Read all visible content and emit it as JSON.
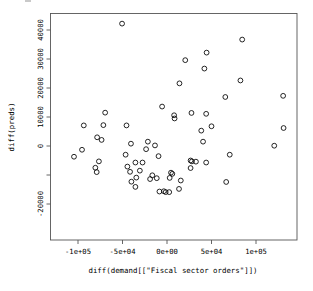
{
  "chart_data": {
    "type": "scatter",
    "title": "",
    "xlabel": "diff(demand[[\"Fiscal sector orders\"]])",
    "ylabel": "diff(preds)",
    "grid": false,
    "legend": null,
    "xlim": [
      -122000,
      136000
    ],
    "ylim": [
      -27000,
      44000
    ],
    "xticks": [
      -100000,
      -50000,
      0,
      50000,
      100000
    ],
    "xtick_labels": [
      "-1e+05",
      "-5e+04",
      "0e+00",
      "5e+04",
      "1e+05"
    ],
    "yticks": [
      40000,
      30000,
      20000,
      10000,
      0,
      -10000,
      -20000
    ],
    "ytick_labels": [
      "40000",
      "30000",
      "20000",
      "10000",
      "0",
      "",
      "-20000"
    ],
    "marker": "open-circle",
    "marker_size": 2.4,
    "point_count": 63,
    "points": [
      [
        -50500,
        42200
      ],
      [
        84500,
        36700
      ],
      [
        44500,
        32200
      ],
      [
        20500,
        29600
      ],
      [
        42000,
        26700
      ],
      [
        14000,
        21600
      ],
      [
        65500,
        16900
      ],
      [
        82500,
        22600
      ],
      [
        130500,
        17300
      ],
      [
        -69500,
        11500
      ],
      [
        -5500,
        13600
      ],
      [
        27500,
        11400
      ],
      [
        8000,
        10600
      ],
      [
        8500,
        9500
      ],
      [
        44000,
        11100
      ],
      [
        -93500,
        7100
      ],
      [
        -71500,
        7200
      ],
      [
        -45500,
        7100
      ],
      [
        50000,
        6800
      ],
      [
        38500,
        5300
      ],
      [
        131000,
        6200
      ],
      [
        -78500,
        3000
      ],
      [
        -73500,
        2100
      ],
      [
        -21500,
        1500
      ],
      [
        -40500,
        800
      ],
      [
        -13500,
        200
      ],
      [
        40500,
        1500
      ],
      [
        120500,
        100
      ],
      [
        -95500,
        -1300
      ],
      [
        -23500,
        -1100
      ],
      [
        -104500,
        -3700
      ],
      [
        -46500,
        -3000
      ],
      [
        -9500,
        -3500
      ],
      [
        70500,
        -3000
      ],
      [
        -76500,
        -5300
      ],
      [
        -35500,
        -5700
      ],
      [
        -27500,
        -5700
      ],
      [
        26500,
        -5000
      ],
      [
        28000,
        -5300
      ],
      [
        32500,
        -5400
      ],
      [
        44000,
        -5700
      ],
      [
        -80500,
        -7500
      ],
      [
        -44500,
        -7100
      ],
      [
        26500,
        -7600
      ],
      [
        -79000,
        -9000
      ],
      [
        -41500,
        -8900
      ],
      [
        4500,
        -9200
      ],
      [
        -34500,
        -10900
      ],
      [
        -11500,
        -11100
      ],
      [
        -19000,
        -11400
      ],
      [
        -40000,
        -12300
      ],
      [
        15500,
        -11900
      ],
      [
        66500,
        -12400
      ],
      [
        -35500,
        -14100
      ],
      [
        13500,
        -14800
      ],
      [
        -3500,
        -15600
      ],
      [
        -8500,
        -15700
      ],
      [
        -1500,
        -15900
      ],
      [
        2500,
        -15900
      ],
      [
        3000,
        -11000
      ],
      [
        -16500,
        -10100
      ],
      [
        6000,
        -9600
      ],
      [
        -30500,
        -8500
      ]
    ]
  },
  "axes": {
    "x_tick_labels": [
      "-1e+05",
      "-5e+04",
      "0e+00",
      "5e+04",
      "1e+05"
    ],
    "y_tick_labels": [
      "40000",
      "30000",
      "20000",
      "10000",
      "0",
      "-20000"
    ],
    "x_axis_title": "diff(demand[[\"Fiscal sector orders\"]])",
    "y_axis_title": "diff(preds)"
  },
  "style": {
    "background_color": "#ffffff",
    "point_stroke_color": "#000000",
    "axis_color": "#555555",
    "text_color": "#000000"
  }
}
